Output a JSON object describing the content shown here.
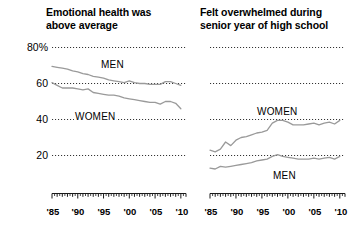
{
  "figure": {
    "background": "#ffffff",
    "line_color": "#9a9a9a",
    "gridline_color": "#3a3a3a",
    "axis_color": "#1a1a1a",
    "text_color": "#000000"
  },
  "panels": [
    {
      "id": "emotional-health",
      "title": "Emotional health was\nabove average",
      "y_ticks": [
        "80%",
        "60",
        "40",
        "20"
      ],
      "x_ticks": [
        "'85",
        "'90",
        "'95",
        "'00",
        "'05",
        "'10"
      ],
      "series_labels": [
        "MEN",
        "WOMEN"
      ]
    },
    {
      "id": "felt-overwhelmed",
      "title": "Felt overwhelmed during\nsenior year of high school",
      "y_ticks": [],
      "x_ticks": [
        "'85",
        "'90",
        "'95",
        "'00",
        "'05",
        "'10"
      ],
      "series_labels": [
        "WOMEN",
        "MEN"
      ]
    }
  ],
  "chart_data": [
    {
      "type": "line",
      "title": "Emotional health was above average",
      "xlabel": "",
      "ylabel": "",
      "ylim": [
        10,
        85
      ],
      "xlim": [
        1985,
        2011
      ],
      "y_ticks": [
        20,
        40,
        60,
        80
      ],
      "y_tick_labels": [
        "20",
        "40",
        "60",
        "80%"
      ],
      "x_ticks": [
        1985,
        1990,
        1995,
        2000,
        2005,
        2010
      ],
      "x_tick_labels": [
        "'85",
        "'90",
        "'95",
        "'00",
        "'05",
        "'10"
      ],
      "grid": "horizontal-dotted",
      "legend": "inline-labels",
      "x": [
        1985,
        1986,
        1987,
        1988,
        1989,
        1990,
        1991,
        1992,
        1993,
        1994,
        1995,
        1996,
        1997,
        1998,
        1999,
        2000,
        2001,
        2002,
        2003,
        2004,
        2005,
        2006,
        2007,
        2008,
        2009,
        2010
      ],
      "series": [
        {
          "name": "MEN",
          "values": [
            69.5,
            69.0,
            68.5,
            68.0,
            67.0,
            66.5,
            65.5,
            65.0,
            64.0,
            63.5,
            63.0,
            62.0,
            61.5,
            61.0,
            60.5,
            61.5,
            60.5,
            60.0,
            60.0,
            59.5,
            59.5,
            59.5,
            61.0,
            61.0,
            60.0,
            59.0
          ]
        },
        {
          "name": "WOMEN",
          "values": [
            60.5,
            59.0,
            57.5,
            57.5,
            57.5,
            57.0,
            56.5,
            57.0,
            55.0,
            54.5,
            54.0,
            53.5,
            53.5,
            53.0,
            52.0,
            51.5,
            51.0,
            50.5,
            50.0,
            49.5,
            49.5,
            48.5,
            50.0,
            50.0,
            49.0,
            46.0
          ]
        }
      ]
    },
    {
      "type": "line",
      "title": "Felt overwhelmed during senior year of high school",
      "xlabel": "",
      "ylabel": "",
      "ylim": [
        10,
        85
      ],
      "xlim": [
        1985,
        2011
      ],
      "y_ticks": [
        20,
        40,
        60,
        80
      ],
      "y_tick_labels": [
        "",
        "",
        "",
        ""
      ],
      "x_ticks": [
        1985,
        1990,
        1995,
        2000,
        2005,
        2010
      ],
      "x_tick_labels": [
        "'85",
        "'90",
        "'95",
        "'00",
        "'05",
        "'10"
      ],
      "grid": "horizontal-dotted",
      "legend": "inline-labels",
      "x": [
        1985,
        1986,
        1987,
        1988,
        1989,
        1990,
        1991,
        1992,
        1993,
        1994,
        1995,
        1996,
        1997,
        1998,
        1999,
        2000,
        2001,
        2002,
        2003,
        2004,
        2005,
        2006,
        2007,
        2008,
        2009,
        2010
      ],
      "series": [
        {
          "name": "WOMEN",
          "values": [
            23.0,
            22.0,
            23.5,
            27.5,
            25.5,
            28.5,
            30.0,
            30.5,
            31.5,
            32.5,
            33.0,
            34.0,
            38.0,
            39.5,
            39.5,
            38.5,
            37.0,
            37.0,
            37.0,
            37.5,
            38.0,
            37.0,
            38.0,
            38.5,
            37.5,
            39.5
          ]
        },
        {
          "name": "MEN",
          "values": [
            13.0,
            12.5,
            14.0,
            13.5,
            14.0,
            14.5,
            15.0,
            15.5,
            16.0,
            17.0,
            17.5,
            18.0,
            19.5,
            20.5,
            19.5,
            19.0,
            18.5,
            18.0,
            18.0,
            18.0,
            18.5,
            18.0,
            18.5,
            19.0,
            18.0,
            19.5
          ]
        }
      ]
    }
  ]
}
